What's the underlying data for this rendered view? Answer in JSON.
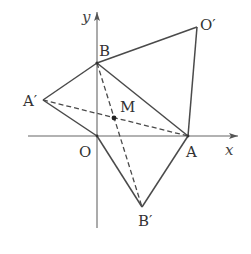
{
  "diagram": {
    "type": "coordinate-geometry",
    "axes": {
      "x_label": "x",
      "y_label": "y"
    },
    "points": {
      "O": {
        "label": "O",
        "px": [
          97,
          136
        ]
      },
      "A": {
        "label": "A",
        "px": [
          188,
          136
        ]
      },
      "B": {
        "label": "B",
        "px": [
          97,
          63
        ]
      },
      "O_prime": {
        "label": "O′",
        "px": [
          197,
          27
        ]
      },
      "A_prime": {
        "label": "A′",
        "px": [
          43,
          100
        ]
      },
      "B_prime": {
        "label": "B′",
        "px": [
          142,
          207
        ]
      },
      "M": {
        "label": "M",
        "px": [
          114,
          118
        ]
      }
    },
    "solid_segments": [
      [
        "B",
        "O_prime"
      ],
      [
        "O_prime",
        "A"
      ],
      [
        "B",
        "A"
      ],
      [
        "A_prime",
        "B"
      ],
      [
        "A_prime",
        "O"
      ],
      [
        "O",
        "B_prime"
      ],
      [
        "B_prime",
        "A"
      ]
    ],
    "dashed_segments": [
      [
        "A_prime",
        "A"
      ],
      [
        "B",
        "B_prime"
      ]
    ],
    "colors": {
      "line": "#4a4a4a",
      "axis": "#666666",
      "text": "#333333"
    }
  }
}
